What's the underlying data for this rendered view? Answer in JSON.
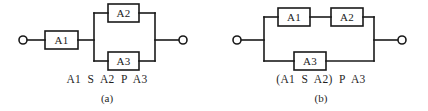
{
  "figure": {
    "type": "reliability-block-diagram",
    "ink_color": "#1a1a1a",
    "background_color": "#ffffff",
    "panels": [
      {
        "id": "a",
        "subcaption": "(a)",
        "expression": "A1  S  A2  P  A3",
        "topology": "A1 in series with the parallel combination of A2 and A3",
        "blocks": [
          {
            "label": "A1",
            "x": 45,
            "y": 31,
            "w": 33,
            "h": 18
          },
          {
            "label": "A2",
            "x": 108,
            "y": 4,
            "w": 31,
            "h": 18
          },
          {
            "label": "A3",
            "x": 108,
            "y": 52,
            "w": 31,
            "h": 18
          }
        ],
        "terminals": [
          {
            "name": "left-terminal",
            "cx": 23,
            "cy": 40,
            "r": 4
          },
          {
            "name": "right-terminal",
            "cx": 183,
            "cy": 40,
            "r": 4
          }
        ]
      },
      {
        "id": "b",
        "subcaption": "(b)",
        "expression": "(A1  S  A2)  P  A3",
        "topology": "A1 in series with A2, that branch in parallel with A3",
        "blocks": [
          {
            "label": "A1",
            "x": 64,
            "y": 8,
            "w": 32,
            "h": 18
          },
          {
            "label": "A2",
            "x": 117,
            "y": 8,
            "w": 32,
            "h": 18
          },
          {
            "label": "A3",
            "x": 80,
            "y": 52,
            "w": 32,
            "h": 18
          }
        ],
        "terminals": [
          {
            "name": "left-terminal",
            "cx": 23,
            "cy": 40,
            "r": 4
          },
          {
            "name": "right-terminal",
            "cx": 188,
            "cy": 40,
            "r": 4
          }
        ]
      }
    ]
  }
}
